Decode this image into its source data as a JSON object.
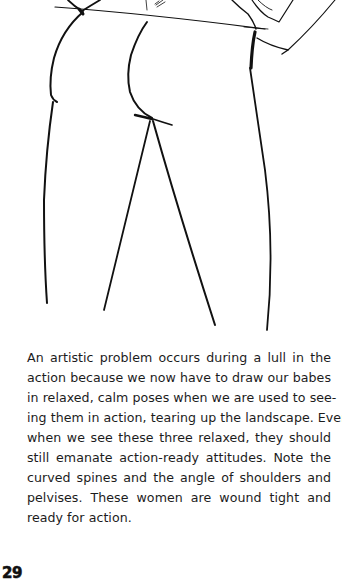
{
  "page": {
    "type": "book-page",
    "background_color": "#ffffff",
    "text_color": "#1c1c1c"
  },
  "illustration": {
    "description": "Pencil sketch of three women's figures from the shoulders down, seen from behind and side, in relaxed standing poses",
    "stroke_color": "#111111"
  },
  "body": {
    "lines": [
      "An artistic problem occurs during a lull in the",
      "action because we now have to draw our babes",
      "in relaxed, calm poses when we are used to see-",
      "ing them in action, tearing up the landscape. Even",
      "when we see these three relaxed, they should",
      "still emanate action-ready attitudes. Note the",
      "curved spines and the angle of shoulders and",
      "pelvises. These women are wound tight and",
      "ready for action."
    ]
  },
  "footer": {
    "page_number": "29"
  }
}
